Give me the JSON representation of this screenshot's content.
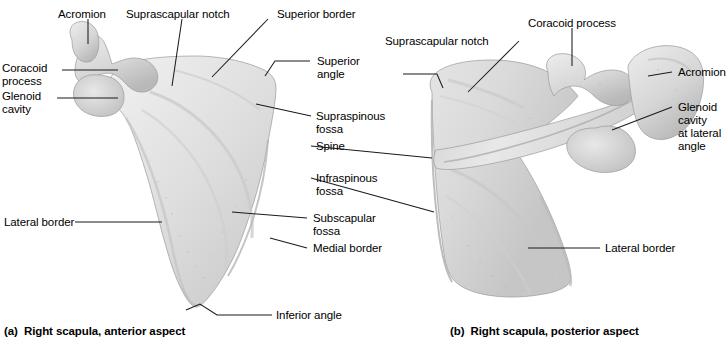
{
  "figure": {
    "background_color": "#ffffff",
    "line_color": "#1a1a1a",
    "bone_fill_light": "#ececec",
    "bone_fill_mid": "#d9d9d9",
    "bone_fill_dark": "#bdbdbd"
  },
  "panel_a": {
    "caption": "(a)  Right scapula, anterior aspect",
    "caption_prefix": "(a)",
    "caption_text": "Right scapula, anterior aspect",
    "labels": {
      "acromion": "Acromion",
      "suprascapular_notch": "Suprascapular notch",
      "superior_border": "Superior border",
      "coracoid_process_line1": "Coracoid",
      "coracoid_process_line2": "process",
      "glenoid_cavity_line1": "Glenoid",
      "glenoid_cavity_line2": "cavity",
      "lateral_border": "Lateral border",
      "inferior_angle": "Inferior angle"
    }
  },
  "panel_center": {
    "labels": {
      "superior_angle_line1": "Superior",
      "superior_angle_line2": "angle",
      "supraspinous_fossa_line1": "Supraspinous",
      "supraspinous_fossa_line2": "fossa",
      "spine": "Spine",
      "infraspinous_fossa_line1": "Infraspinous",
      "infraspinous_fossa_line2": "fossa",
      "subscapular_fossa_line1": "Subscapular",
      "subscapular_fossa_line2": "fossa",
      "medial_border": "Medial border"
    }
  },
  "panel_b": {
    "caption": "(b)  Right scapula, posterior aspect",
    "caption_prefix": "(b)",
    "caption_text": "Right scapula, posterior aspect",
    "labels": {
      "suprascapular_notch": "Suprascapular notch",
      "coracoid_process": "Coracoid process",
      "acromion": "Acromion",
      "glenoid_cavity_line1": "Glenoid",
      "glenoid_cavity_line2": "cavity",
      "glenoid_cavity_line3": "at lateral",
      "glenoid_cavity_line4": "angle",
      "lateral_border": "Lateral border"
    }
  }
}
